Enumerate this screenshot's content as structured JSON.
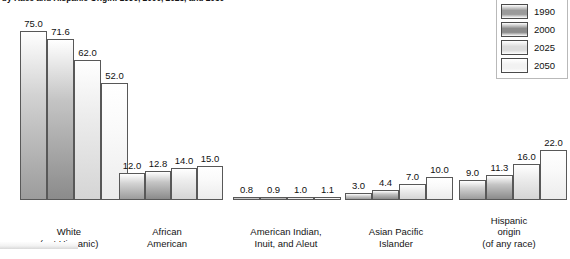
{
  "title": "by Race and Hispanic Origin: 1990, 2000, 2025, and 2050",
  "legend": {
    "items": [
      {
        "label": "1990",
        "color": "#9a9a9a"
      },
      {
        "label": "2000",
        "color": "#8c8c8c"
      },
      {
        "label": "2025",
        "color": "#dcdcdc"
      },
      {
        "label": "2050",
        "color": "#f2f2f2"
      }
    ]
  },
  "chart_data": {
    "type": "bar",
    "title": "by Race and Hispanic Origin: 1990, 2000, 2025, and 2050",
    "xlabel": "",
    "ylabel": "",
    "ylim": [
      0,
      80
    ],
    "grid": false,
    "legend_position": "top-right",
    "categories": [
      "White\n(not Hispanic)",
      "African\nAmerican",
      "American Indian,\nInuit, and Aleut",
      "Asian Pacific\nIslander",
      "Hispanic\norigin\n(of any race)"
    ],
    "series": [
      {
        "name": "1990",
        "values": [
          75.0,
          12.0,
          0.8,
          3.0,
          9.0
        ]
      },
      {
        "name": "2000",
        "values": [
          71.6,
          12.8,
          0.9,
          4.4,
          11.3
        ]
      },
      {
        "name": "2025",
        "values": [
          62.0,
          14.0,
          1.0,
          7.0,
          16.0
        ]
      },
      {
        "name": "2050",
        "values": [
          52.0,
          15.0,
          1.1,
          10.0,
          22.0
        ]
      }
    ]
  },
  "groups": [
    {
      "name": "white-not-hispanic",
      "label_lines": [
        "White",
        "(not Hispanic)"
      ],
      "bars": [
        {
          "year": "1990",
          "value": "75.0"
        },
        {
          "year": "2000",
          "value": "71.6"
        },
        {
          "year": "2025",
          "value": "62.0"
        },
        {
          "year": "2050",
          "value": "52.0"
        }
      ]
    },
    {
      "name": "african-american",
      "label_lines": [
        "African",
        "American"
      ],
      "bars": [
        {
          "year": "1990",
          "value": "12.0"
        },
        {
          "year": "2000",
          "value": "12.8"
        },
        {
          "year": "2025",
          "value": "14.0"
        },
        {
          "year": "2050",
          "value": "15.0"
        }
      ]
    },
    {
      "name": "american-indian-inuit-aleut",
      "label_lines": [
        "American Indian,",
        "Inuit, and Aleut"
      ],
      "bars": [
        {
          "year": "1990",
          "value": "0.8"
        },
        {
          "year": "2000",
          "value": "0.9"
        },
        {
          "year": "2025",
          "value": "1.0"
        },
        {
          "year": "2050",
          "value": "1.1"
        }
      ]
    },
    {
      "name": "asian-pacific-islander",
      "label_lines": [
        "Asian Pacific",
        "Islander"
      ],
      "bars": [
        {
          "year": "1990",
          "value": "3.0"
        },
        {
          "year": "2000",
          "value": "4.4"
        },
        {
          "year": "2025",
          "value": "7.0"
        },
        {
          "year": "2050",
          "value": "10.0"
        }
      ]
    },
    {
      "name": "hispanic-origin",
      "label_lines": [
        "Hispanic",
        "origin",
        "(of any race)"
      ],
      "bars": [
        {
          "year": "1990",
          "value": "9.0"
        },
        {
          "year": "2000",
          "value": "11.3"
        },
        {
          "year": "2025",
          "value": "16.0"
        },
        {
          "year": "2050",
          "value": "22.0"
        }
      ]
    }
  ]
}
